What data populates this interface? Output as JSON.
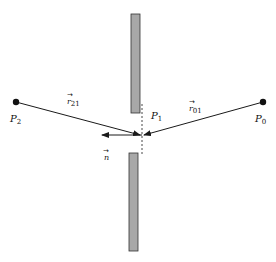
{
  "diagram": {
    "points": {
      "P0": {
        "label": "P",
        "sub": "0",
        "x": 263,
        "y": 102
      },
      "P1": {
        "label": "P",
        "sub": "1",
        "x": 142,
        "y": 135
      },
      "P2": {
        "label": "P",
        "sub": "2",
        "x": 16,
        "y": 102
      }
    },
    "vectors": {
      "r21": {
        "label": "r",
        "sub": "21",
        "arrow": "→"
      },
      "r01": {
        "label": "r",
        "sub": "01",
        "arrow": "→"
      },
      "n": {
        "label": "n",
        "arrow": "→"
      }
    },
    "colors": {
      "line": "#1a1a1a",
      "screen_fill": "#a8a8a8",
      "screen_stroke": "#333333"
    }
  }
}
